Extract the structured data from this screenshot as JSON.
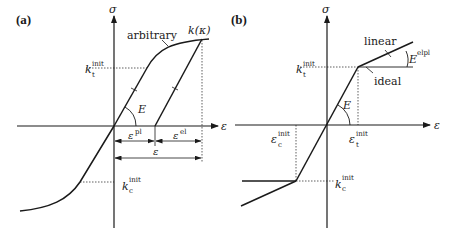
{
  "figure": {
    "panels": [
      {
        "id": "a",
        "panel_label": "(a)",
        "axes": {
          "y_label": "σ",
          "x_label": "ε"
        },
        "curve_label": "arbitrary",
        "hardening_label": "k(κ)",
        "elastic_modulus_label": "E",
        "tension_yield": {
          "base": "k",
          "sub": "t",
          "sup": "init"
        },
        "compression_yield": {
          "base": "k",
          "sub": "c",
          "sup": "init"
        },
        "strain_components": {
          "plastic": {
            "base": "ε",
            "sup": "pl"
          },
          "elastic": {
            "base": "ε",
            "sup": "el"
          },
          "total": {
            "base": "ε"
          }
        }
      },
      {
        "id": "b",
        "panel_label": "(b)",
        "axes": {
          "y_label": "σ",
          "x_label": "ε"
        },
        "linear_label": "linear",
        "ideal_label": "ideal",
        "elastic_modulus_label": "E",
        "elastoplastic_modulus": {
          "base": "E",
          "sup": "elpl"
        },
        "tension_yield": {
          "base": "k",
          "sub": "t",
          "sup": "init"
        },
        "compression_yield": {
          "base": "k",
          "sub": "c",
          "sup": "init"
        },
        "tension_strain": {
          "base": "ε",
          "sub": "t",
          "sup": "init"
        },
        "compression_strain": {
          "base": "ε",
          "sub": "c",
          "sup": "init"
        }
      }
    ]
  },
  "colors": {
    "line": "#1a1a1a",
    "background": "#ffffff"
  }
}
